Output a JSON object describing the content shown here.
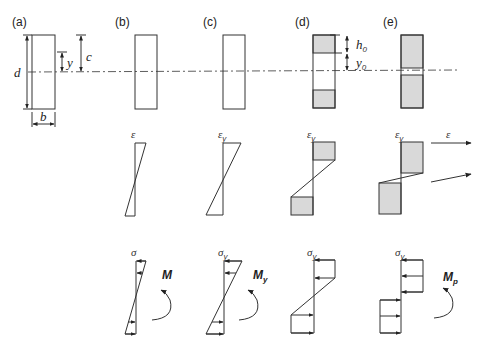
{
  "figure": {
    "panels": [
      {
        "id": "a",
        "label": "(a)"
      },
      {
        "id": "b",
        "label": "(b)"
      },
      {
        "id": "c",
        "label": "(c)"
      },
      {
        "id": "d",
        "label": "(d)"
      },
      {
        "id": "e",
        "label": "(e)"
      }
    ],
    "dimensions": {
      "depth": "d",
      "width": "b",
      "distance_y": "y",
      "distance_c": "c",
      "elastic_core_h": "h",
      "elastic_core_h_sub": "0",
      "elastic_core_y": "y",
      "elastic_core_y_sub": "0"
    },
    "strain_labels": {
      "b": {
        "sym": "ε",
        "sub": ""
      },
      "c": {
        "sym": "ε",
        "sub": "y"
      },
      "d": {
        "sym": "ε",
        "sub": "y"
      },
      "e": {
        "sym": "ε",
        "sub": "y"
      },
      "arrow": {
        "sym": "ε",
        "sub": ""
      }
    },
    "stress_labels": {
      "b": {
        "sym": "σ",
        "sub": ""
      },
      "c": {
        "sym": "σ",
        "sub": "y"
      },
      "d": {
        "sym": "σ",
        "sub": "y"
      },
      "e": {
        "sym": "σ",
        "sub": "y"
      }
    },
    "moments": {
      "b": {
        "sym": "M",
        "sub": ""
      },
      "c": {
        "sym": "M",
        "sub": "y"
      },
      "e": {
        "sym": "M",
        "sub": "p"
      }
    },
    "colors": {
      "line": "#333333",
      "yielded_fill": "#d9d9d9"
    }
  }
}
